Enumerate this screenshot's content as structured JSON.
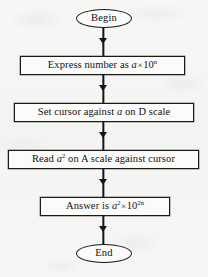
{
  "diagram": {
    "background_color": "#f6f6f5",
    "line_color": "#161616",
    "node_fill": "#fbfbfa"
  },
  "nodes": {
    "begin": {
      "shape": "terminator",
      "label": "Begin"
    },
    "step1": {
      "shape": "process",
      "label": "Express number as a × 10ⁿ",
      "text_before": "Express number as ",
      "variable": "a",
      "operator": "×",
      "base": "10",
      "exponent": "n"
    },
    "step2": {
      "shape": "process",
      "label": "Set cursor against a on D scale",
      "text_before": "Set cursor against ",
      "variable": "a",
      "text_after": " on D scale"
    },
    "step3": {
      "shape": "process",
      "label": "Read a² on A scale against cursor",
      "text_before": "Read ",
      "variable": "a",
      "exponent": "2",
      "text_after": " on A scale against cursor"
    },
    "step4": {
      "shape": "process",
      "label": "Answer is a² × 10²ⁿ",
      "text_before": "Answer is ",
      "variable": "a",
      "var_exponent": "2",
      "operator": "×",
      "base": "10",
      "exponent": "2n"
    },
    "end": {
      "shape": "terminator",
      "label": "End"
    }
  },
  "connectors": [
    {
      "from": "begin",
      "to": "step1",
      "arrow": "down"
    },
    {
      "from": "step1",
      "to": "step2",
      "arrow": "down"
    },
    {
      "from": "step2",
      "to": "step3",
      "arrow": "down"
    },
    {
      "from": "step3",
      "to": "step4",
      "arrow": "down"
    },
    {
      "from": "step4",
      "to": "end",
      "arrow": "down"
    }
  ]
}
